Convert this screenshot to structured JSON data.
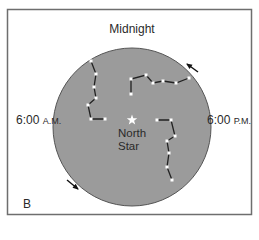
{
  "figure": {
    "panel_label": "B",
    "title": "Midnight",
    "left_label": {
      "time": "6:00",
      "suffix": "A.M."
    },
    "right_label": {
      "time": "6:00",
      "suffix": "P.M."
    },
    "center_label": {
      "line1": "North",
      "line2": "Star"
    },
    "colors": {
      "sky_disc": "#9b9b9b",
      "disc_outline": "#555555",
      "frame": "#6e6e6e",
      "star": "#ffffff",
      "constellation_line": "#222222",
      "arrow": "#111111",
      "text": "#2a2a2a"
    },
    "rotation_direction": "counterclockwise",
    "arrows": [
      {
        "name": "arrow-upper-right",
        "from": [
          198,
          72
        ],
        "to": [
          187,
          64
        ]
      },
      {
        "name": "arrow-lower-left",
        "from": [
          67,
          180
        ],
        "to": [
          78,
          189
        ]
      }
    ],
    "north_star": {
      "x": 132,
      "y": 120
    },
    "constellations": [
      {
        "name": "constellation-left",
        "points": [
          [
            91,
            61
          ],
          [
            96,
            74
          ],
          [
            94,
            87
          ],
          [
            96,
            98
          ],
          [
            88,
            105
          ],
          [
            91,
            119
          ],
          [
            105,
            119
          ]
        ]
      },
      {
        "name": "constellation-top",
        "points": [
          [
            131,
            94
          ],
          [
            131,
            79
          ],
          [
            146,
            75
          ],
          [
            153,
            83
          ],
          [
            163,
            81
          ],
          [
            176,
            83
          ],
          [
            189,
            78
          ]
        ]
      },
      {
        "name": "constellation-right",
        "points": [
          [
            157,
            120
          ],
          [
            171,
            120
          ],
          [
            175,
            136
          ],
          [
            167,
            141
          ],
          [
            169,
            153
          ],
          [
            167,
            167
          ],
          [
            172,
            180
          ]
        ]
      }
    ]
  }
}
